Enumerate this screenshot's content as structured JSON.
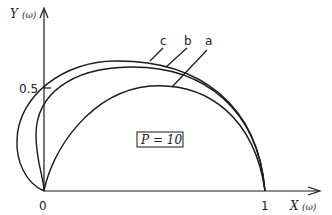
{
  "figure": {
    "y_axis_label": "Y",
    "y_axis_var": "(ω)",
    "x_axis_label": "X",
    "x_axis_var": "(ω)",
    "origin_label": "0",
    "x_tick_label": "1",
    "y_tick_label": "0.5",
    "parameter_box": "P = 10",
    "curve_labels": [
      "c",
      "b",
      "a"
    ]
  },
  "colors": {
    "ink": "#1a1a1a",
    "background": "#ffffff"
  }
}
